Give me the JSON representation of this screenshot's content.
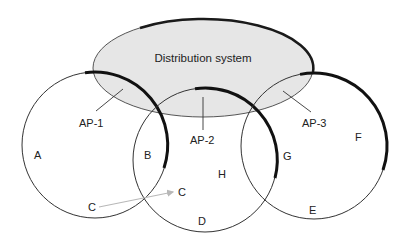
{
  "diagram": {
    "distribution_system": {
      "label": "Distribution system",
      "fill": "#e6e6e6",
      "stroke": "#1a1a1a"
    },
    "access_points": [
      {
        "id": "AP-1",
        "label": "AP-1"
      },
      {
        "id": "AP-2",
        "label": "AP-2"
      },
      {
        "id": "AP-3",
        "label": "AP-3"
      }
    ],
    "stations": [
      {
        "id": "A",
        "label": "A"
      },
      {
        "id": "B",
        "label": "B"
      },
      {
        "id": "C1",
        "label": "C"
      },
      {
        "id": "C2",
        "label": "C"
      },
      {
        "id": "D",
        "label": "D"
      },
      {
        "id": "E",
        "label": "E"
      },
      {
        "id": "F",
        "label": "F"
      },
      {
        "id": "G",
        "label": "G"
      },
      {
        "id": "H",
        "label": "H"
      }
    ],
    "movement_arrow": {
      "from": "C",
      "to": "C",
      "color": "#b8b8b8"
    }
  }
}
